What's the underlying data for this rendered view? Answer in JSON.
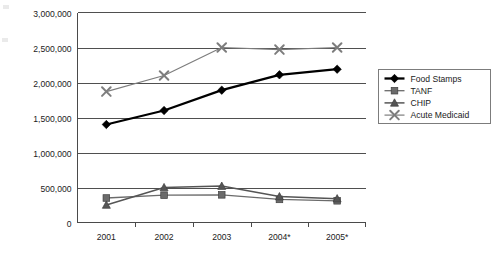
{
  "chart_data": {
    "type": "line",
    "title": "",
    "subtitle": "",
    "xlabel": "",
    "ylabel": "",
    "categories": [
      "2001",
      "2002",
      "2003",
      "2004*",
      "2005*"
    ],
    "ylim": [
      0,
      3000000
    ],
    "ytick_values": [
      0,
      500000,
      1000000,
      1500000,
      2000000,
      2500000,
      3000000
    ],
    "ytick_labels": [
      "0",
      "500,000",
      "1,000,000",
      "1,500,000",
      "2,000,000",
      "2,500,000",
      "3,000,000"
    ],
    "grid": "horizontal",
    "legend_position": "right",
    "series": [
      {
        "name": "Food Stamps",
        "marker": "diamond",
        "color": "#000000",
        "line_width": 2.3,
        "values": [
          1400000,
          1600000,
          1890000,
          2110000,
          2190000
        ]
      },
      {
        "name": "TANF",
        "marker": "square",
        "color": "#6b6b6b",
        "line_width": 1.3,
        "values": [
          350000,
          390000,
          395000,
          330000,
          310000
        ]
      },
      {
        "name": "CHIP",
        "marker": "triangle",
        "color": "#555555",
        "line_width": 1.5,
        "values": [
          250000,
          500000,
          520000,
          370000,
          340000
        ]
      },
      {
        "name": "Acute Medicaid",
        "marker": "x",
        "color": "#7d7d7d",
        "line_width": 1.2,
        "values": [
          1870000,
          2100000,
          2500000,
          2470000,
          2500000
        ]
      }
    ]
  },
  "legend": {
    "entries": [
      {
        "label": "Food Stamps"
      },
      {
        "label": "TANF"
      },
      {
        "label": "CHIP"
      },
      {
        "label": "Acute Medicaid"
      }
    ]
  },
  "axes": {
    "y_labels": [
      "3,000,000",
      "2,500,000",
      "2,000,000",
      "1,500,000",
      "1,000,000",
      "500,000",
      "0"
    ],
    "x_labels": [
      "2001",
      "2002",
      "2003",
      "2004*",
      "2005*"
    ]
  }
}
